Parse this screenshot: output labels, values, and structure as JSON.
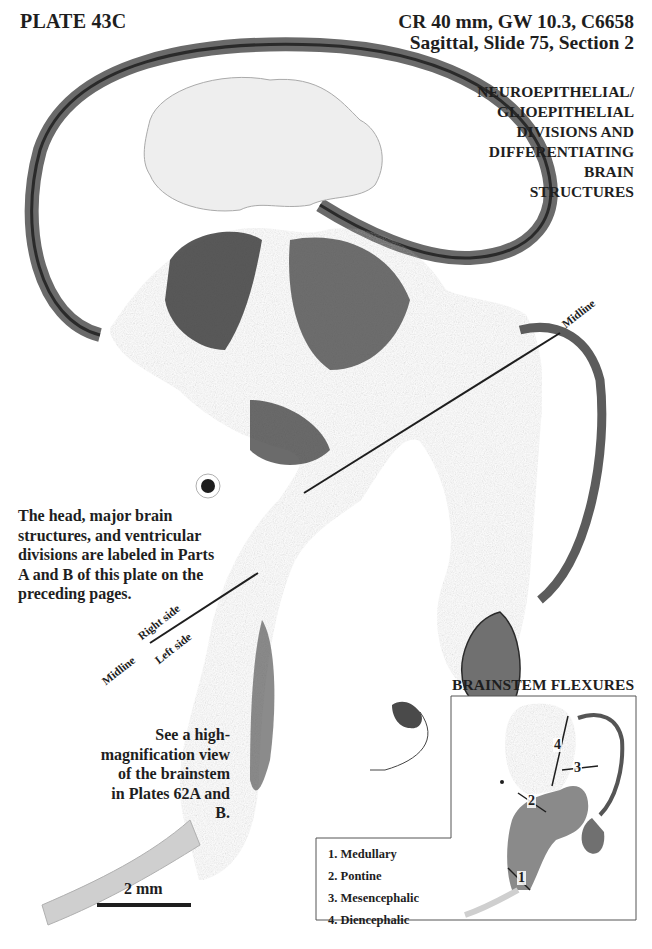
{
  "header": {
    "plate_title": "PLATE 43C",
    "specimen_line1": "CR 40 mm, GW 10.3, C6658",
    "specimen_line2": "Sagittal, Slide 75, Section 2",
    "section_heading_lines": [
      "NEUROEPITHELIAL/",
      "GLIOEPITHELIAL",
      "DIVISIONS AND",
      "DIFFERENTIATING",
      "BRAIN",
      "STRUCTURES"
    ]
  },
  "notes": {
    "labels_note_lines": [
      "The head, major brain",
      "structures, and ventricular",
      "divisions are labeled in Parts",
      "A and B of this plate on the",
      "preceding pages."
    ],
    "brainstem_note_lines": [
      "See a high-",
      "magnification view",
      "of the brainstem",
      "in Plates 62A and B."
    ]
  },
  "orientation_labels": {
    "midline_upper": "Midline",
    "midline_lower": "Midline",
    "right_side": "Right side",
    "left_side": "Left side"
  },
  "scale_bar": {
    "label": "2 mm"
  },
  "inset": {
    "title": "BRAINSTEM FLEXURES",
    "markers": [
      "1",
      "2",
      "3",
      "4"
    ],
    "legend": [
      "1. Medullary",
      "2. Pontine",
      "3. Mesencephalic",
      "4. Diencephalic"
    ]
  },
  "colors": {
    "text": "#1e1e1e",
    "tissue_dark": "#3c3c3c",
    "tissue_mid": "#8a8a8a",
    "tissue_light": "#c8c8c8",
    "background": "#ffffff"
  }
}
